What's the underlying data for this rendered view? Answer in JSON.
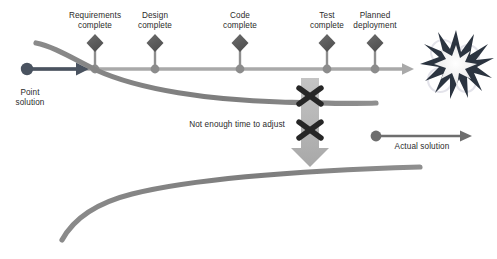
{
  "diagram": {
    "background_color": "#ffffff",
    "colors": {
      "timeline": "#a9a9a9",
      "milestone_diamond": "#595959",
      "milestone_dot": "#8c8c8c",
      "point_solution_accent": "#3f4a57",
      "curve_gray": "#808080",
      "x_mark": "#262626",
      "down_arrow": "#b3b3b3",
      "explosion_dark": "#2b3440",
      "explosion_light": "#f2f2f2",
      "text": "#2b2b2b"
    },
    "milestones": [
      {
        "id": "requirements-complete",
        "label": "Requirements\ncomplete",
        "x": 95,
        "label_x": 53,
        "label_y": 11
      },
      {
        "id": "design-complete",
        "label": "Design\ncomplete",
        "x": 155,
        "label_x": 113,
        "label_y": 11
      },
      {
        "id": "code-complete",
        "label": "Code\ncomplete",
        "x": 240,
        "label_x": 198,
        "label_y": 11
      },
      {
        "id": "test-complete",
        "label": "Test\ncomplete",
        "x": 327,
        "label_x": 285,
        "label_y": 11
      },
      {
        "id": "planned-deployment",
        "label": "Planned\ndeployment",
        "x": 375,
        "label_x": 333,
        "label_y": 11
      }
    ],
    "annotations": {
      "point_solution": {
        "label": "Point\nsolution",
        "x": 11,
        "y": 88
      },
      "actual_solution": {
        "label": "Actual solution",
        "x": 377,
        "y": 142
      },
      "not_enough_time": {
        "label": "Not enough time to adjust",
        "x": 180,
        "y": 120
      }
    },
    "legend_arrows": [
      {
        "id": "point-solution-arrow",
        "from_x": 24,
        "from_y": 69,
        "to_x": 88,
        "to_y": 69,
        "color": "#3f4a57"
      },
      {
        "id": "actual-solution-arrow",
        "from_x": 372,
        "from_y": 136,
        "to_x": 472,
        "to_y": 136,
        "color": "#6e6e6e"
      }
    ],
    "timeline": {
      "id": "planned-timeline",
      "start_x": 30,
      "end_x": 412,
      "y": 69,
      "color": "#a9a9a9"
    },
    "curves": [
      {
        "id": "actual-progress-curve-upper",
        "description": "Descending gray curve crossing the timeline near Requirements complete",
        "color": "#808080"
      },
      {
        "id": "actual-progress-curve-lower",
        "description": "Rising gray curve at the bottom representing the actual delivered solution",
        "color": "#808080"
      }
    ],
    "blockers": [
      {
        "id": "blocker-x-upper",
        "x": 310,
        "y": 97
      },
      {
        "id": "blocker-x-lower",
        "x": 310,
        "y": 130
      }
    ],
    "down_arrow": {
      "id": "adjust-down-arrow",
      "x": 310,
      "top_y": 78,
      "bottom_y": 165,
      "color": "#b3b3b3"
    },
    "explosion": {
      "id": "failure-explosion",
      "cx": 456,
      "cy": 66,
      "r": 33
    }
  }
}
